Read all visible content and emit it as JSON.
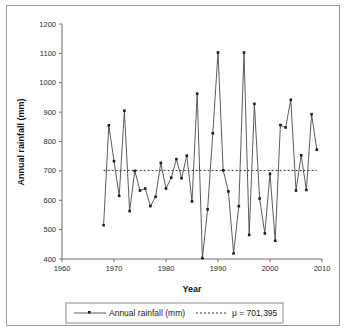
{
  "chart_data": {
    "type": "line",
    "title": "",
    "xlabel": "Year",
    "ylabel": "Annual rainfall (mm)",
    "xlim": [
      1960,
      2010
    ],
    "ylim": [
      400,
      1200
    ],
    "xticks": [
      1960,
      1970,
      1980,
      1990,
      2000,
      2010
    ],
    "yticks": [
      400,
      500,
      600,
      700,
      800,
      900,
      1000,
      1100,
      1200
    ],
    "grid": false,
    "legend_position": "bottom",
    "series": [
      {
        "name": "Annual rainfall (mm)",
        "marker": "square",
        "x": [
          1968,
          1969,
          1970,
          1971,
          1972,
          1973,
          1974,
          1975,
          1976,
          1977,
          1978,
          1979,
          1980,
          1981,
          1982,
          1983,
          1984,
          1985,
          1986,
          1987,
          1988,
          1989,
          1990,
          1991,
          1992,
          1993,
          1994,
          1995,
          1996,
          1997,
          1998,
          1999,
          2000,
          2001,
          2002,
          2003,
          2004,
          2005,
          2006,
          2007,
          2008,
          2009
        ],
        "values": [
          515,
          855,
          733,
          615,
          905,
          563,
          700,
          633,
          640,
          580,
          612,
          727,
          640,
          677,
          740,
          675,
          752,
          596,
          963,
          403,
          569,
          828,
          1103,
          702,
          630,
          419,
          580,
          1103,
          482,
          928,
          606,
          487,
          690,
          462,
          856,
          848,
          942,
          633,
          753,
          635,
          893,
          772
        ]
      }
    ],
    "mean_line": {
      "label": "μ = 701,395",
      "value": 701.395,
      "style": "dotted"
    }
  },
  "legend": {
    "entries": [
      {
        "label": "Annual rainfall (mm)",
        "style": "line-marker"
      },
      {
        "label": "μ = 701,395",
        "style": "dotted"
      }
    ]
  },
  "axes": {
    "x_title": "Year",
    "y_title": "Annual rainfall (mm)",
    "x_tick_labels": [
      "1960",
      "1970",
      "1980",
      "1990",
      "2000",
      "2010"
    ],
    "y_tick_labels": [
      "400",
      "500",
      "600",
      "700",
      "800",
      "900",
      "1000",
      "1100",
      "1200"
    ]
  },
  "colors": {
    "series": "#4a4a4a",
    "mean": "#3a3a3a",
    "axis": "#6e6e6e",
    "frame": "#9a9a9a",
    "background": "#ffffff"
  }
}
